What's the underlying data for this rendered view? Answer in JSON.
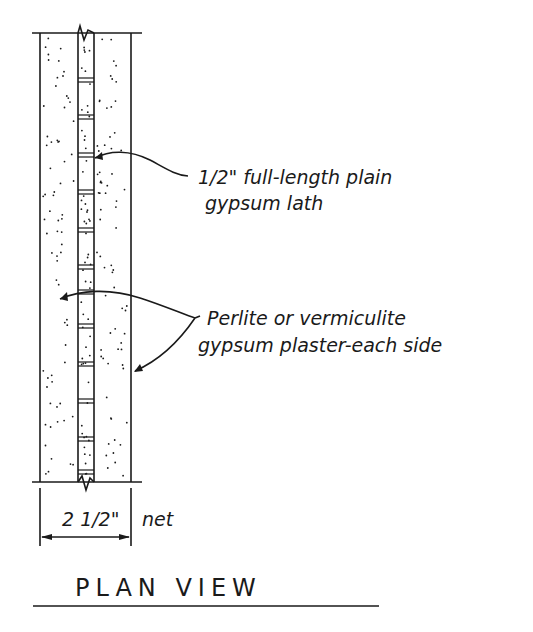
{
  "drawing": {
    "title": "PLAN VIEW",
    "labels": {
      "lath": {
        "line1": "1/2\" full-length plain",
        "line2": "gypsum lath"
      },
      "plaster": {
        "line1": "Perlite or vermiculite",
        "line2": "gypsum plaster-each side"
      }
    },
    "dimension": {
      "value": "2 1/2\"",
      "suffix": "net"
    },
    "colors": {
      "ink": "#1a1a1a",
      "paper": "#ffffff"
    }
  }
}
